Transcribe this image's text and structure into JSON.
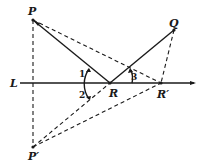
{
  "figure": {
    "labels": {
      "P": "P",
      "Q": "Q",
      "R": "R",
      "R_prime": "R′",
      "P_prime": "P′",
      "L": "L"
    },
    "angles": {
      "angle1": "1",
      "angle2": "2",
      "angle3": "3"
    },
    "segments": [
      {
        "from": "P",
        "to": "R",
        "style": "solid"
      },
      {
        "from": "R",
        "to": "Q",
        "style": "solid"
      },
      {
        "from": "P",
        "to": "R_prime",
        "style": "dashed"
      },
      {
        "from": "Q",
        "to": "R_prime",
        "style": "dashed"
      },
      {
        "from": "P",
        "to": "P_prime",
        "style": "dashed"
      },
      {
        "from": "P_prime",
        "to": "R",
        "style": "dashed"
      },
      {
        "from": "P_prime",
        "to": "R_prime",
        "style": "dashed"
      }
    ],
    "line": {
      "name": "L",
      "style": "solid",
      "through": [
        "R",
        "R_prime"
      ]
    }
  }
}
